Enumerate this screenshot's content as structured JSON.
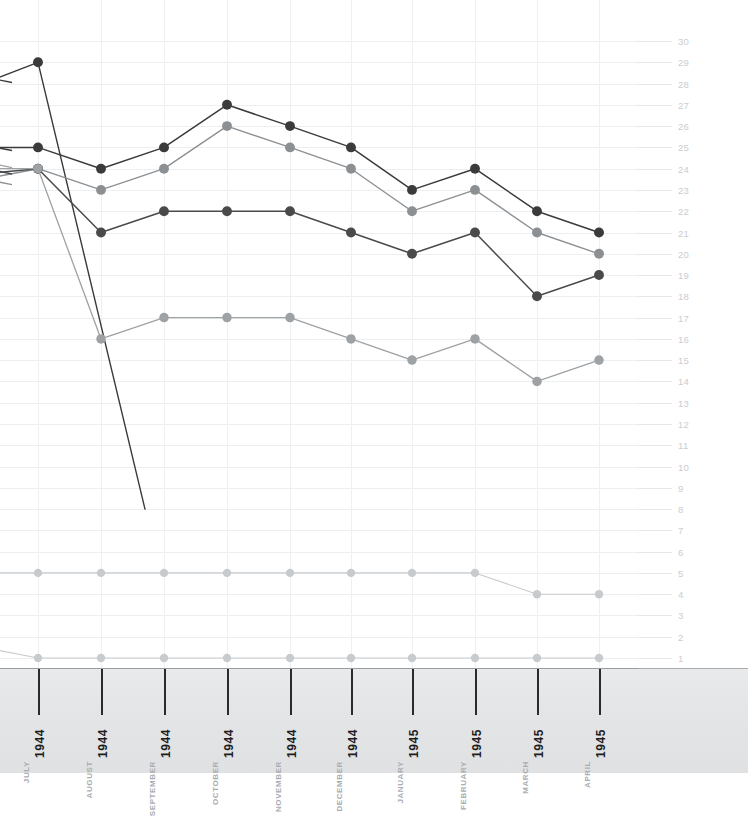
{
  "chart_data": {
    "type": "line",
    "title": "",
    "subtitle": "",
    "xlabel": "",
    "ylabel": "",
    "grid": true,
    "legend": "none",
    "xlim_note": "partial view, left edge cropped mid-series",
    "ylim": [
      1,
      30
    ],
    "y_ticks": [
      30,
      29,
      28,
      27,
      26,
      25,
      24,
      23,
      22,
      21,
      20,
      19,
      18,
      17,
      16,
      15,
      14,
      13,
      12,
      11,
      10,
      9,
      8,
      7,
      6,
      5,
      4,
      3,
      2,
      1
    ],
    "y_axis_position": "right",
    "categories": [
      "JULY 1944",
      "AUGUST 1944",
      "SEPTEMBER 1944",
      "OCTOBER 1944",
      "NOVEMBER 1944",
      "DECEMBER 1944",
      "JANUARY 1945",
      "FEBRUARY 1945",
      "MARCH 1945",
      "APRIL 1945"
    ],
    "x_tick_months": [
      "JULY",
      "AUGUST",
      "SEPTEMBER",
      "OCTOBER",
      "NOVEMBER",
      "DECEMBER",
      "JANUARY",
      "FEBRUARY",
      "MARCH",
      "APRIL"
    ],
    "x_tick_years": [
      "1944",
      "1944",
      "1944",
      "1944",
      "1944",
      "1944",
      "1945",
      "1945",
      "1945",
      "1945"
    ],
    "series": [
      {
        "name": "series-1-steep-decline",
        "color": "#3a3a3a",
        "width": 1.4,
        "marker": 5.2,
        "values": [
          29,
          null,
          null,
          null,
          null,
          null,
          null,
          null,
          null,
          null
        ],
        "lead_in": 28.2,
        "tail_to": 8.0,
        "note": "dark line peaking at 29 in July 1944 then falling steeply off-plot"
      },
      {
        "name": "series-2-dark",
        "color": "#3b3b3b",
        "width": 1.5,
        "marker": 5.2,
        "values": [
          25,
          24,
          25,
          27,
          26,
          25,
          23,
          24,
          22,
          21
        ],
        "lead_in": 25.0
      },
      {
        "name": "series-3-mid-grey",
        "color": "#8d9093",
        "width": 1.4,
        "marker": 5.2,
        "values": [
          24,
          23,
          24,
          26,
          25,
          24,
          22,
          23,
          21,
          20
        ],
        "lead_in": 23.6
      },
      {
        "name": "series-4-dark-low",
        "color": "#4a4a4a",
        "width": 1.5,
        "marker": 5.2,
        "values": [
          24,
          21,
          22,
          22,
          22,
          21,
          20,
          21,
          18,
          19
        ],
        "lead_in": 23.8
      },
      {
        "name": "series-5-light-grey",
        "color": "#9ea2a5",
        "width": 1.3,
        "marker": 5.0,
        "values": [
          24,
          16,
          17,
          17,
          17,
          16,
          15,
          16,
          14,
          15
        ],
        "lead_in": 24.0
      },
      {
        "name": "series-6-faint-five",
        "color": "#c8cbce",
        "width": 1.1,
        "marker": 4.4,
        "values": [
          5,
          5,
          5,
          5,
          5,
          5,
          5,
          5,
          4,
          4
        ],
        "lead_in": 5.0
      },
      {
        "name": "series-7-faint-one",
        "color": "#c8cbce",
        "width": 1.1,
        "marker": 4.4,
        "values": [
          1,
          1,
          1,
          1,
          1,
          1,
          1,
          1,
          1,
          1
        ],
        "lead_in": 1.4
      }
    ]
  },
  "colors": {
    "background": "#ffffff",
    "grid": "#eceff1",
    "axis_strip": "#e4e5e7",
    "axis_rule": "#9a9da0",
    "tick_label_month": "#a9adb1",
    "tick_label_year": "#1d1d1d",
    "y_label": "#c9cdd1"
  }
}
